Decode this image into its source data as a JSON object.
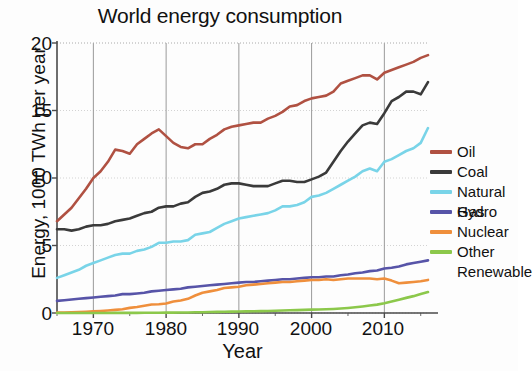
{
  "chart_data": {
    "type": "line",
    "title": "World energy consumption",
    "xlabel": "Year",
    "ylabel": "Energy, 1000 TWh per year",
    "xlim": [
      1965,
      2016
    ],
    "ylim": [
      0,
      20
    ],
    "xticks": [
      1970,
      1980,
      1990,
      2000,
      2010
    ],
    "yticks": [
      0,
      5,
      10,
      15,
      20
    ],
    "grid": true,
    "legend_position": "right",
    "x": [
      1965,
      1966,
      1967,
      1968,
      1969,
      1970,
      1971,
      1972,
      1973,
      1974,
      1975,
      1976,
      1977,
      1978,
      1979,
      1980,
      1981,
      1982,
      1983,
      1984,
      1985,
      1986,
      1987,
      1988,
      1989,
      1990,
      1991,
      1992,
      1993,
      1994,
      1995,
      1996,
      1997,
      1998,
      1999,
      2000,
      2001,
      2002,
      2003,
      2004,
      2005,
      2006,
      2007,
      2008,
      2009,
      2010,
      2011,
      2012,
      2013,
      2014,
      2015,
      2016
    ],
    "series": [
      {
        "name": "Oil",
        "color": "#b05142",
        "values": [
          6.8,
          7.3,
          7.8,
          8.5,
          9.2,
          10.0,
          10.5,
          11.2,
          12.1,
          12.0,
          11.8,
          12.5,
          12.9,
          13.3,
          13.6,
          13.1,
          12.6,
          12.3,
          12.2,
          12.5,
          12.5,
          12.9,
          13.2,
          13.6,
          13.8,
          13.9,
          14.0,
          14.1,
          14.1,
          14.4,
          14.6,
          14.9,
          15.3,
          15.4,
          15.7,
          15.9,
          16.0,
          16.1,
          16.4,
          17.0,
          17.2,
          17.4,
          17.6,
          17.6,
          17.3,
          17.8,
          18.0,
          18.2,
          18.4,
          18.6,
          18.9,
          19.1
        ]
      },
      {
        "name": "Coal",
        "color": "#3a3a3a",
        "values": [
          6.2,
          6.2,
          6.1,
          6.2,
          6.4,
          6.5,
          6.5,
          6.6,
          6.8,
          6.9,
          7.0,
          7.2,
          7.4,
          7.5,
          7.8,
          7.9,
          7.9,
          8.1,
          8.2,
          8.6,
          8.9,
          9.0,
          9.2,
          9.5,
          9.6,
          9.6,
          9.5,
          9.4,
          9.4,
          9.4,
          9.6,
          9.8,
          9.8,
          9.7,
          9.7,
          9.9,
          10.1,
          10.4,
          11.2,
          12.0,
          12.7,
          13.3,
          13.9,
          14.1,
          14.0,
          14.8,
          15.7,
          16.0,
          16.4,
          16.4,
          16.2,
          17.1
        ]
      },
      {
        "name": "Natural Gas",
        "color": "#79d4e8",
        "values": [
          2.6,
          2.8,
          3.0,
          3.2,
          3.5,
          3.7,
          3.9,
          4.1,
          4.3,
          4.4,
          4.4,
          4.6,
          4.7,
          4.9,
          5.2,
          5.2,
          5.3,
          5.3,
          5.4,
          5.8,
          5.9,
          6.0,
          6.3,
          6.6,
          6.8,
          7.0,
          7.1,
          7.2,
          7.3,
          7.4,
          7.6,
          7.9,
          7.9,
          8.0,
          8.2,
          8.6,
          8.7,
          8.9,
          9.2,
          9.5,
          9.8,
          10.1,
          10.5,
          10.7,
          10.5,
          11.2,
          11.4,
          11.7,
          12.0,
          12.2,
          12.6,
          13.7
        ]
      },
      {
        "name": "Hydro",
        "color": "#5754a8",
        "values": [
          0.9,
          0.95,
          1.0,
          1.05,
          1.1,
          1.15,
          1.2,
          1.25,
          1.3,
          1.4,
          1.4,
          1.45,
          1.5,
          1.6,
          1.65,
          1.7,
          1.75,
          1.8,
          1.9,
          1.95,
          2.0,
          2.05,
          2.1,
          2.15,
          2.2,
          2.25,
          2.3,
          2.3,
          2.35,
          2.4,
          2.45,
          2.5,
          2.5,
          2.55,
          2.6,
          2.65,
          2.65,
          2.7,
          2.7,
          2.8,
          2.85,
          2.95,
          3.0,
          3.1,
          3.15,
          3.3,
          3.35,
          3.45,
          3.6,
          3.7,
          3.8,
          3.9
        ]
      },
      {
        "name": "Nuclear",
        "color": "#ef8f3c",
        "values": [
          0.03,
          0.04,
          0.05,
          0.07,
          0.09,
          0.12,
          0.15,
          0.19,
          0.23,
          0.28,
          0.38,
          0.45,
          0.54,
          0.63,
          0.65,
          0.7,
          0.85,
          0.93,
          1.05,
          1.3,
          1.5,
          1.6,
          1.7,
          1.85,
          1.9,
          1.95,
          2.05,
          2.1,
          2.15,
          2.2,
          2.25,
          2.3,
          2.3,
          2.35,
          2.4,
          2.45,
          2.45,
          2.5,
          2.45,
          2.5,
          2.55,
          2.55,
          2.55,
          2.55,
          2.5,
          2.55,
          2.4,
          2.2,
          2.25,
          2.3,
          2.35,
          2.45
        ]
      },
      {
        "name": "Other Renewable",
        "color": "#8cc84b",
        "values": [
          0.0,
          0.0,
          0.0,
          0.0,
          0.0,
          0.0,
          0.0,
          0.0,
          0.01,
          0.01,
          0.01,
          0.01,
          0.02,
          0.02,
          0.02,
          0.03,
          0.03,
          0.04,
          0.04,
          0.05,
          0.06,
          0.07,
          0.08,
          0.09,
          0.1,
          0.11,
          0.12,
          0.13,
          0.14,
          0.15,
          0.17,
          0.18,
          0.2,
          0.21,
          0.23,
          0.25,
          0.26,
          0.28,
          0.3,
          0.33,
          0.37,
          0.42,
          0.48,
          0.55,
          0.62,
          0.72,
          0.85,
          0.98,
          1.12,
          1.25,
          1.4,
          1.55
        ]
      }
    ]
  },
  "legend": {
    "items": [
      {
        "label": "Oil"
      },
      {
        "label": "Coal"
      },
      {
        "label": "Natural Gas"
      },
      {
        "label": "Hydro"
      },
      {
        "label": "Nuclear"
      },
      {
        "label": "Other\nRenewable"
      }
    ]
  },
  "axes": {
    "ytick_labels": [
      "20",
      "15",
      "10",
      "5",
      "0"
    ],
    "xtick_labels": [
      "1970",
      "1980",
      "1990",
      "2000",
      "2010"
    ]
  }
}
